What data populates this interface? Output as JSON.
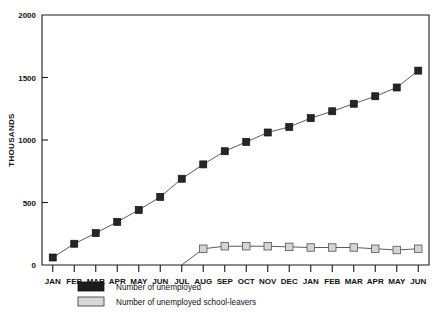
{
  "chart_data": {
    "type": "line",
    "title": "",
    "xlabel": "",
    "ylabel": "THOUSANDS",
    "ylim": [
      0,
      2000
    ],
    "yticks": [
      0,
      500,
      1000,
      1500,
      2000
    ],
    "ytick_labels": [
      "0",
      "500",
      "1000",
      "1500",
      "2000"
    ],
    "grid": false,
    "legend_position": "bottom-left",
    "categories": [
      "JAN",
      "FEB",
      "MAR",
      "APR",
      "MAY",
      "JUN",
      "JUL",
      "AUG",
      "SEP",
      "OCT",
      "NOV",
      "DEC",
      "JAN",
      "FEB",
      "MAR",
      "APR",
      "MAY",
      "JUN"
    ],
    "series": [
      {
        "name": "Number of unemployed",
        "marker": "filled-square",
        "color": "#262626",
        "values": [
          60,
          170,
          255,
          345,
          440,
          545,
          690,
          805,
          910,
          985,
          1060,
          1105,
          1175,
          1230,
          1290,
          1350,
          1420,
          1555
        ]
      },
      {
        "name": "Number of unemployed school-leavers",
        "marker": "open-square",
        "color": "#d4d4d4",
        "values": [
          null,
          null,
          null,
          null,
          null,
          null,
          0,
          130,
          150,
          150,
          150,
          145,
          140,
          140,
          140,
          130,
          120,
          130
        ]
      }
    ]
  },
  "legend": {
    "items": [
      {
        "label": "Number of unemployed"
      },
      {
        "label": "Number of unemployed school-leavers"
      }
    ]
  },
  "axes": {
    "y_title": "THOUSANDS"
  }
}
